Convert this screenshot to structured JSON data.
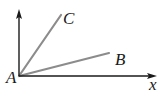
{
  "diagram": {
    "type": "geometry-rays",
    "origin": {
      "label": "A",
      "x": 19,
      "y": 76
    },
    "axes": {
      "vertical": {
        "from": [
          19,
          76
        ],
        "to": [
          19,
          10
        ],
        "arrow": true
      },
      "horizontal": {
        "from": [
          19,
          76
        ],
        "to": [
          157,
          76
        ],
        "arrow": true,
        "label": "x"
      }
    },
    "rays": [
      {
        "label": "C",
        "to": [
          61,
          15
        ]
      },
      {
        "label": "B",
        "to": [
          109,
          53
        ]
      }
    ],
    "colors": {
      "axis": "#1a1a1a",
      "ray": "#8c8c8c",
      "text": "#1a1a1a"
    }
  },
  "labels": {
    "A": "A",
    "B": "B",
    "C": "C",
    "x": "x"
  }
}
